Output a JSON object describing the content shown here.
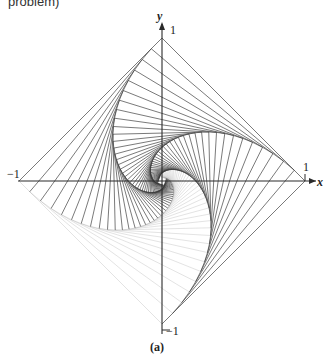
{
  "header": {
    "truncated_text": "problem)"
  },
  "figure": {
    "caption": "(a)",
    "axis_labels": {
      "x": "x",
      "y": "y"
    },
    "tick_labels": {
      "top": "1",
      "right": "1",
      "bottom": "−1",
      "left": "−1"
    },
    "geometry": {
      "origin_px": [
        162,
        181
      ],
      "unit_px": 143,
      "steps": 46,
      "step_fraction": 0.075
    },
    "colors": {
      "ink": "#3a3a3a",
      "ink_faint": "#cfcfcf",
      "axis": "#2a2a2a",
      "background": "#ffffff"
    },
    "quadrant_opacity": {
      "q1": 0.85,
      "q2": 0.85,
      "q3": 0.18,
      "q4": 0.85
    }
  },
  "chart_data": {
    "type": "diagram",
    "vertices": [
      [
        0,
        1
      ],
      [
        -1,
        0
      ],
      [
        0,
        -1
      ],
      [
        1,
        0
      ]
    ],
    "xlabel": "x",
    "ylabel": "y",
    "xlim": [
      -1,
      1
    ],
    "ylim": [
      -1,
      1
    ],
    "tick_labels": [
      "-1",
      "1",
      "-1",
      "1"
    ]
  }
}
